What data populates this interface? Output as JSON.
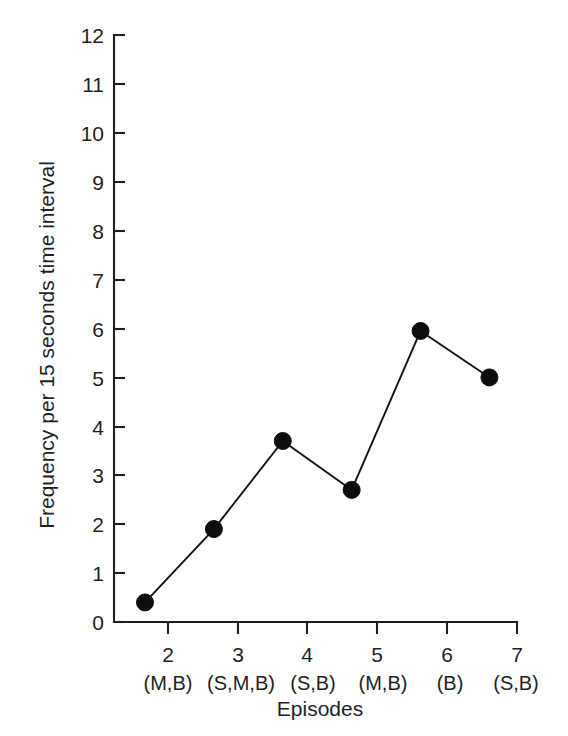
{
  "chart_data": {
    "type": "line",
    "title": "",
    "xlabel": "Episodes",
    "ylabel": "Frequency per 15 seconds time interval",
    "categories": [
      "2",
      "3",
      "4",
      "5",
      "6",
      "7"
    ],
    "x": [
      2,
      3,
      4,
      5,
      6,
      7
    ],
    "values": [
      0.4,
      1.9,
      3.7,
      2.7,
      5.95,
      5.0
    ],
    "point_labels": [
      "(M,B)",
      "(S,M,B)",
      "(S,B)",
      "(M,B)",
      "(B)",
      "(S,B)"
    ],
    "xlim": [
      1.55,
      7.4
    ],
    "ylim": [
      0,
      12
    ],
    "ytick_labels": [
      "0",
      "1",
      "2",
      "3",
      "4",
      "5",
      "6",
      "7",
      "8",
      "9",
      "10",
      "11",
      "12"
    ],
    "yticks": [
      0,
      1,
      2,
      3,
      4,
      5,
      6,
      7,
      8,
      9,
      10,
      11,
      12
    ],
    "xtick_labels": [
      "2",
      "3",
      "4",
      "5",
      "6",
      "7"
    ],
    "grid": false,
    "legend": "none",
    "marker": "filled-circle",
    "line_color": "#111111",
    "marker_color": "#0d0d0d",
    "axis_color": "#1f1f1f",
    "background_color": "#ffffff"
  },
  "axes": {
    "y_axis_label": "Frequency per 15 seconds time interval",
    "x_axis_label": "Episodes"
  }
}
